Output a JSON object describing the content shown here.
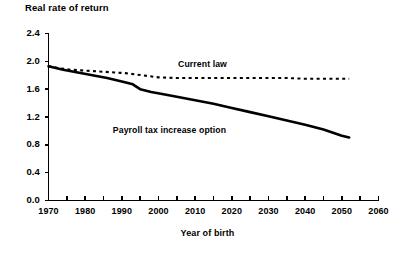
{
  "chart_data": {
    "type": "line",
    "title": "Real rate of return",
    "xlabel": "Year of birth",
    "ylabel": "",
    "xlim": [
      1970,
      2060
    ],
    "ylim": [
      0.0,
      2.4
    ],
    "grid": false,
    "legend_position": "inline-annotation",
    "ytick_labels": [
      "2.4",
      "2.0",
      "1.6",
      "1.2",
      "0.8",
      "0.4",
      "0.0"
    ],
    "ytick_values": [
      2.4,
      2.0,
      1.6,
      1.2,
      0.8,
      0.4,
      0.0
    ],
    "xtick_labels": [
      "1970",
      "1980",
      "1990",
      "2000",
      "2010",
      "2020",
      "2030",
      "2040",
      "2050",
      "2060"
    ],
    "xtick_values": [
      1970,
      1980,
      1990,
      2000,
      2010,
      2020,
      2030,
      2040,
      2050,
      2060
    ],
    "xminor_step": 5,
    "series": [
      {
        "name": "Current law",
        "style": "dashed",
        "color": "#000000",
        "label_x": 2012,
        "label_y": 1.95,
        "x": [
          1970,
          1973,
          1976,
          1979,
          1982,
          1985,
          1988,
          1991,
          1994,
          1997,
          2000,
          2005,
          2010,
          2015,
          2020,
          2025,
          2030,
          2035,
          2040,
          2045,
          2050,
          2052
        ],
        "values": [
          1.93,
          1.9,
          1.88,
          1.87,
          1.86,
          1.85,
          1.84,
          1.83,
          1.81,
          1.79,
          1.77,
          1.76,
          1.76,
          1.76,
          1.76,
          1.76,
          1.76,
          1.76,
          1.75,
          1.75,
          1.75,
          1.75
        ]
      },
      {
        "name": "Payroll tax increase option",
        "style": "solid",
        "color": "#000000",
        "label_x": 2003,
        "label_y": 1.0,
        "x": [
          1970,
          1974,
          1978,
          1982,
          1986,
          1990,
          1993,
          1995,
          1998,
          2001,
          2005,
          2010,
          2015,
          2020,
          2025,
          2030,
          2035,
          2040,
          2045,
          2050,
          2052
        ],
        "values": [
          1.93,
          1.88,
          1.84,
          1.8,
          1.76,
          1.71,
          1.67,
          1.6,
          1.56,
          1.53,
          1.49,
          1.44,
          1.39,
          1.33,
          1.27,
          1.21,
          1.15,
          1.09,
          1.02,
          0.93,
          0.905
        ]
      }
    ]
  }
}
